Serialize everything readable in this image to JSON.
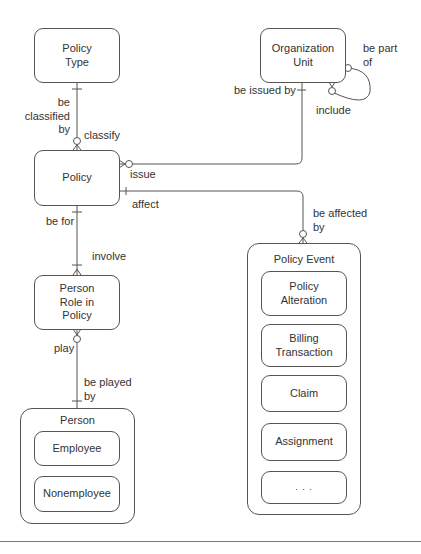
{
  "entities": {
    "policy_type": "Policy Type",
    "organization_unit": "Organization Unit",
    "policy": "Policy",
    "person_role_in_policy": "Person Role in Policy",
    "policy_event": "Policy Event",
    "person": "Person"
  },
  "subtypes": {
    "policy_event": [
      "Policy Alteration",
      "Billing Transaction",
      "Claim",
      "Assignment",
      ". . ."
    ],
    "person": [
      "Employee",
      "Nonemployee"
    ]
  },
  "relationships": {
    "policy_type_policy": {
      "from_label": "be classified by",
      "to_label": "classify"
    },
    "org_unit_policy": {
      "from_label": "be issued by",
      "to_label": "issue"
    },
    "org_unit_self": {
      "from_label": "be part of",
      "to_label": "include"
    },
    "policy_event": {
      "from_label": "affect",
      "to_label": "be affected by"
    },
    "policy_person_role": {
      "from_label": "be for",
      "to_label": "involve"
    },
    "person_role_person": {
      "from_label": "play",
      "to_label": "be played by"
    }
  },
  "labels": {
    "be_classified_by_1": "be",
    "be_classified_by_2": "classified",
    "be_classified_by_3": "by",
    "classify": "classify",
    "be_issued_by": "be issued by",
    "issue": "issue",
    "be_part_of_1": "be part",
    "be_part_of_2": "of",
    "include": "include",
    "affect": "affect",
    "be_affected_by_1": "be affected",
    "be_affected_by_2": "by",
    "be_for": "be for",
    "involve": "involve",
    "play": "play",
    "be_played_by_1": "be played",
    "be_played_by_2": "by"
  },
  "box_text": {
    "policy_type_1": "Policy",
    "policy_type_2": "Type",
    "org_unit_1": "Organization",
    "org_unit_2": "Unit",
    "policy": "Policy",
    "person_role_1": "Person",
    "person_role_2": "Role in",
    "person_role_3": "Policy",
    "policy_alteration_1": "Policy",
    "policy_alteration_2": "Alteration",
    "billing_transaction_1": "Billing",
    "billing_transaction_2": "Transaction",
    "claim": "Claim",
    "assignment": "Assignment",
    "more": ". . .",
    "employee": "Employee",
    "nonemployee": "Nonemployee"
  },
  "colors": {
    "line": "#555555",
    "text": "#333333",
    "background": "#ffffff"
  }
}
